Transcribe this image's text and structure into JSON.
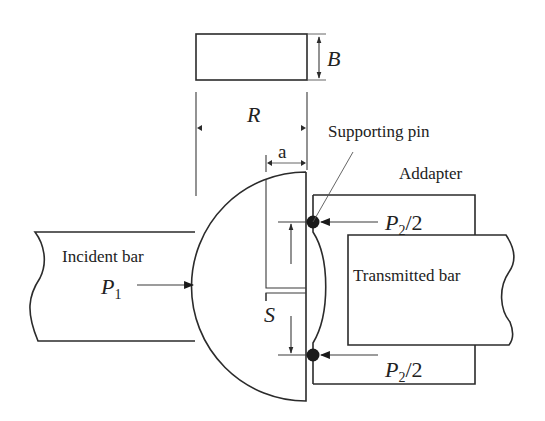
{
  "labels": {
    "thickness": "B",
    "radius": "R",
    "crack_length": "a",
    "span": "S",
    "supporting_pin": "Supporting pin",
    "adapter": "Addapter",
    "incident_bar": "Incident bar",
    "incident_force_main": "P",
    "incident_force_sub": "1",
    "transmitted_bar": "Transmitted bar",
    "reaction_top_main": "P",
    "reaction_top_sub": "2",
    "reaction_top_suffix": "/2",
    "reaction_bottom_main": "P",
    "reaction_bottom_sub": "2",
    "reaction_bottom_suffix": "/2"
  },
  "colors": {
    "line": "#2b2b2b",
    "text": "#222222",
    "background": "#ffffff",
    "pin": "#1a1a1a"
  }
}
